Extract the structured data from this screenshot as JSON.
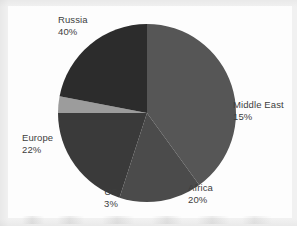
{
  "chart_data": {
    "type": "pie",
    "title": "",
    "subtitle": "",
    "xlabel": "",
    "ylabel": "",
    "legend_position": "none",
    "grid": false,
    "labels_position": "outside",
    "total_percent": 100,
    "categories": [
      "Russia",
      "Middle East",
      "Africa",
      "US",
      "Europe"
    ],
    "values": [
      40,
      15,
      20,
      3,
      22
    ],
    "slices": [
      {
        "name": "Russia",
        "label": "Russia",
        "value": 40,
        "value_label": "40%",
        "color": "#565656",
        "start_angle_deg": 0,
        "end_angle_deg": 144
      },
      {
        "name": "Middle East",
        "label": "Middle East",
        "value": 15,
        "value_label": "15%",
        "color": "#4b4b4b",
        "start_angle_deg": 144,
        "end_angle_deg": 198
      },
      {
        "name": "Africa",
        "label": "Africa",
        "value": 20,
        "value_label": "20%",
        "color": "#3a3a3a",
        "start_angle_deg": 198,
        "end_angle_deg": 270
      },
      {
        "name": "US",
        "label": "US",
        "value": 3,
        "value_label": "3%",
        "color": "#9c9c9c",
        "start_angle_deg": 270,
        "end_angle_deg": 280.8
      },
      {
        "name": "Europe",
        "label": "Europe",
        "value": 22,
        "value_label": "22%",
        "color": "#2c2c2c",
        "start_angle_deg": 280.8,
        "end_angle_deg": 360
      }
    ],
    "geometry": {
      "center_x": 147,
      "center_y": 113,
      "radius": 89
    },
    "colors": {
      "russia": "#565656",
      "middle_east": "#4b4b4b",
      "africa": "#3a3a3a",
      "us": "#9c9c9c",
      "europe": "#2c2c2c",
      "background": "#fdfdfd",
      "page_margin": "#f1f1f1",
      "label_text": "#3d3d3d"
    }
  }
}
